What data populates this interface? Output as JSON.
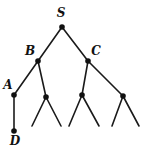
{
  "diagram": {
    "type": "tree",
    "colors": {
      "line": "#1a1a1a",
      "node": "#111111",
      "background": "#ffffff"
    },
    "nodes": [
      {
        "id": "S",
        "label": "S",
        "x": 62,
        "y": 27,
        "lx": 61,
        "ly": 17
      },
      {
        "id": "B",
        "label": "B",
        "x": 38,
        "y": 61,
        "lx": 30,
        "ly": 55
      },
      {
        "id": "C",
        "label": "C",
        "x": 88,
        "y": 61,
        "lx": 96,
        "ly": 55
      },
      {
        "id": "A",
        "label": "A",
        "x": 14,
        "y": 95,
        "lx": 8,
        "ly": 89
      },
      {
        "id": "B2",
        "label": "",
        "x": 46,
        "y": 97
      },
      {
        "id": "C1",
        "label": "",
        "x": 82,
        "y": 95
      },
      {
        "id": "C2",
        "label": "",
        "x": 123,
        "y": 96
      },
      {
        "id": "D",
        "label": "D",
        "x": 14,
        "y": 131,
        "lx": 15,
        "ly": 145
      }
    ],
    "edges": [
      [
        "S",
        "B"
      ],
      [
        "S",
        "C"
      ],
      [
        "B",
        "A"
      ],
      [
        "B",
        "B2"
      ],
      [
        "C",
        "C1"
      ],
      [
        "C",
        "C2"
      ],
      [
        "A",
        "D"
      ]
    ],
    "leaf_stubs": [
      {
        "from": "B2",
        "x": 32,
        "y": 126
      },
      {
        "from": "B2",
        "x": 61,
        "y": 126
      },
      {
        "from": "C1",
        "x": 69,
        "y": 126
      },
      {
        "from": "C1",
        "x": 99,
        "y": 126
      },
      {
        "from": "C2",
        "x": 112,
        "y": 126
      },
      {
        "from": "C2",
        "x": 139,
        "y": 126
      }
    ]
  }
}
